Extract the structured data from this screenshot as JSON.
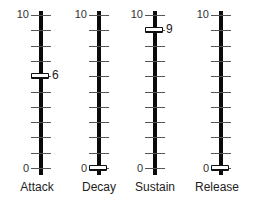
{
  "scale": {
    "max_label": "10",
    "min_label": "0",
    "max": 10,
    "min": 0,
    "tick_count": 11
  },
  "sliders": [
    {
      "name": "Attack",
      "value": 6,
      "value_label": "6",
      "show_value": true,
      "x": 41,
      "label_x": 37
    },
    {
      "name": "Decay",
      "value": 0,
      "value_label": "0",
      "show_value": false,
      "x": 99,
      "label_x": 99
    },
    {
      "name": "Sustain",
      "value": 9,
      "value_label": "9",
      "show_value": true,
      "x": 155,
      "label_x": 155
    },
    {
      "name": "Release",
      "value": 0,
      "value_label": "0",
      "show_value": false,
      "x": 221,
      "label_x": 217
    }
  ],
  "colors": {
    "track": "#0a0a0a",
    "tick": "#555555",
    "handle_fill": "#ffffff",
    "handle_border": "#111111"
  }
}
